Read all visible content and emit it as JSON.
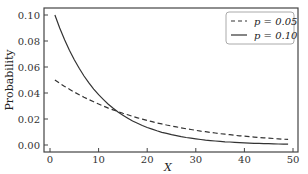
{
  "chart_data": {
    "type": "line",
    "title": "",
    "xlabel": "X",
    "ylabel": "Probability",
    "xlim": [
      -2,
      51
    ],
    "ylim": [
      -0.002,
      0.104
    ],
    "x_ticks": [
      "0",
      "10",
      "20",
      "30",
      "40",
      "50"
    ],
    "y_ticks": [
      "0.00",
      "0.02",
      "0.04",
      "0.06",
      "0.08",
      "0.10"
    ],
    "grid": false,
    "legend_position": "upper right",
    "distribution": "geometric P(X=k)=p(1-p)^(k-1), k=1..49",
    "x": [
      1,
      2,
      3,
      4,
      5,
      6,
      7,
      8,
      9,
      10,
      11,
      12,
      13,
      14,
      15,
      16,
      17,
      18,
      19,
      20,
      21,
      22,
      23,
      24,
      25,
      26,
      27,
      28,
      29,
      30,
      31,
      32,
      33,
      34,
      35,
      36,
      37,
      38,
      39,
      40,
      41,
      42,
      43,
      44,
      45,
      46,
      47,
      48,
      49
    ],
    "series": [
      {
        "name": "p=0.05",
        "style": "dashed",
        "values": [
          0.05,
          0.0475,
          0.0451,
          0.0429,
          0.0407,
          0.0387,
          0.0368,
          0.0349,
          0.0332,
          0.0315,
          0.0299,
          0.0284,
          0.027,
          0.0257,
          0.0244,
          0.0232,
          0.022,
          0.0209,
          0.0199,
          0.0189,
          0.0179,
          0.017,
          0.0162,
          0.0154,
          0.0146,
          0.0139,
          0.0132,
          0.0125,
          0.0119,
          0.0113,
          0.0107,
          0.0102,
          0.0097,
          0.0092,
          0.0087,
          0.0083,
          0.0079,
          0.0075,
          0.0071,
          0.0068,
          0.0064,
          0.0061,
          0.0058,
          0.0055,
          0.0052,
          0.005,
          0.0047,
          0.0045,
          0.0043
        ]
      },
      {
        "name": "p=0.10",
        "style": "solid",
        "values": [
          0.1,
          0.09,
          0.081,
          0.0729,
          0.0656,
          0.059,
          0.0531,
          0.0478,
          0.043,
          0.0387,
          0.0349,
          0.0314,
          0.0282,
          0.0254,
          0.0229,
          0.0206,
          0.0185,
          0.0167,
          0.015,
          0.0135,
          0.0122,
          0.0109,
          0.0098,
          0.0089,
          0.008,
          0.0072,
          0.0065,
          0.0058,
          0.0052,
          0.0047,
          0.0042,
          0.0038,
          0.0034,
          0.0031,
          0.0028,
          0.0025,
          0.0023,
          0.002,
          0.0018,
          0.0016,
          0.0015,
          0.0013,
          0.0012,
          0.0011,
          0.001,
          0.0009,
          0.0008,
          0.0007,
          0.0006
        ]
      }
    ]
  },
  "legend": {
    "items": [
      {
        "label": "p = 0.05"
      },
      {
        "label": "p = 0.10"
      }
    ]
  },
  "axes": {
    "xlabel": "X",
    "ylabel": "Probability"
  }
}
